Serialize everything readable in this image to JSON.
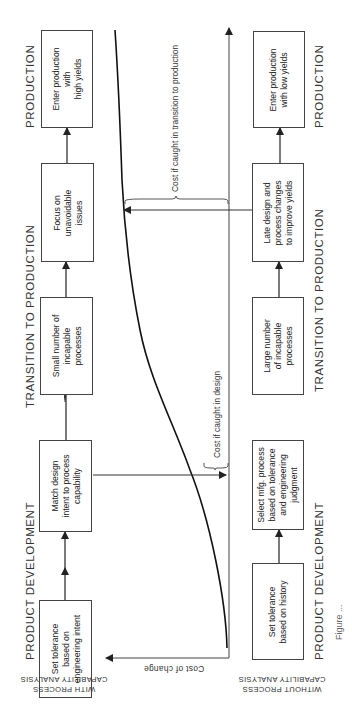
{
  "diagram": {
    "orientation": "rotated -90deg (reads bottom-to-top)",
    "rows": [
      {
        "label": "WITH PROCESS\nCAPABILITY ANALYSIS",
        "boxes": [
          "Set tolerance\nbased on\nengineering intent",
          "Match design\nintent to process\ncapability",
          "Small number of\nincapable\nprocesses",
          "Focus on\nunavoidable\nissues",
          "Enter production\nwith\nhigh yields"
        ]
      },
      {
        "label": "WITHOUT PROCESS\nCAPABILITY ANALYSIS",
        "boxes": [
          "Set tolerance\nbased on history",
          "Select mfg. process\nbased on tolerance\nand engineering\njudgment",
          "Large number\nof incapable\nprocesses",
          "Late design and\nprocess changes\nto improve yields",
          "Enter production\nwith low yields"
        ]
      }
    ],
    "phases_top": [
      "PRODUCT DEVELOPMENT",
      "TRANSITION TO PRODUCTION",
      "PRODUCTION"
    ],
    "phases_bottom": [
      "PRODUCT DEVELOPMENT",
      "TRANSITION TO PRODUCTION",
      "PRODUCTION"
    ],
    "axis_label": "Cost of change",
    "annotations": {
      "design": "Cost if caught in design",
      "transition": "Cost if caught in transition to production"
    },
    "caption": "Figure ..."
  }
}
